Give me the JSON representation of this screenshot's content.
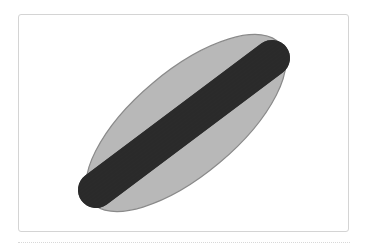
{
  "figure": {
    "bun": {
      "shape": "ellipse",
      "fill": "#b8b8b8",
      "stroke": "#8a8a8a",
      "cx": 186,
      "cy": 123,
      "rx": 123,
      "ry": 52,
      "rotation": -40
    },
    "sausage": {
      "shape": "rounded-bar",
      "fill": "#2a2a2a",
      "x1": 96,
      "y1": 190,
      "x2": 272,
      "y2": 58,
      "thickness": 36
    }
  },
  "colors": {
    "card_border": "#d4d4d4",
    "background": "#ffffff",
    "divider": "#d8d8d8"
  }
}
